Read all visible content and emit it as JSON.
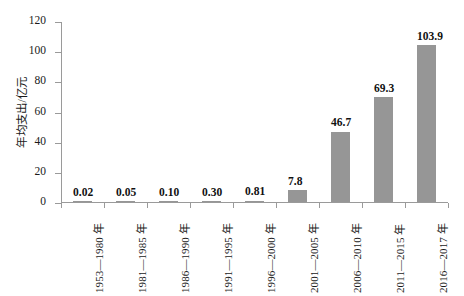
{
  "chart_data": {
    "type": "bar",
    "title": "",
    "xlabel": "",
    "ylabel": "年均支出/亿元",
    "ylim": [
      0,
      120
    ],
    "yticks": [
      0,
      20,
      40,
      60,
      80,
      100,
      120
    ],
    "grid": false,
    "legend": false,
    "bar_color": "#969696",
    "axis_color": "#9a9a9a",
    "categories": [
      "1953—1980 年",
      "1981—1985 年",
      "1986—1990 年",
      "1991—1995 年",
      "1996—2000 年",
      "2001—2005 年",
      "2006—2010 年",
      "2011—2015 年",
      "2016—2017 年"
    ],
    "values": [
      0.02,
      0.05,
      0.1,
      0.3,
      0.81,
      7.8,
      46.7,
      69.3,
      103.9
    ],
    "value_labels": [
      "0.02",
      "0.05",
      "0.10",
      "0.30",
      "0.81",
      "7.8",
      "46.7",
      "69.3",
      "103.9"
    ]
  }
}
